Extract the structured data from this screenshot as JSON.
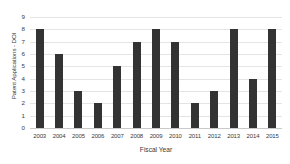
{
  "chart_data": {
    "type": "bar",
    "title": "",
    "xlabel": "Fiscal Year",
    "ylabel": "Patent Applications - DOI",
    "categories": [
      "2003",
      "2004",
      "2005",
      "2006",
      "2007",
      "2008",
      "2009",
      "2010",
      "2011",
      "2012",
      "2013",
      "2014",
      "2015"
    ],
    "values": [
      8,
      6,
      3,
      2,
      5,
      7,
      8,
      7,
      2,
      3,
      8,
      4,
      8
    ],
    "ylim": [
      0,
      9
    ],
    "ytick_labels": [
      "9",
      "8",
      "7",
      "6",
      "5",
      "4",
      "3",
      "2",
      "1",
      "0"
    ],
    "ytick_values": [
      9,
      8,
      7,
      6,
      5,
      4,
      3,
      2,
      1,
      0
    ],
    "grid": true,
    "legend": false,
    "legend_position": "none",
    "bar_color": "#333333",
    "gridline_color": "#e4e4e4",
    "axis_color": "#c9c9c9",
    "background_color": "#ffffff",
    "text_color": "#3a3a3a"
  }
}
